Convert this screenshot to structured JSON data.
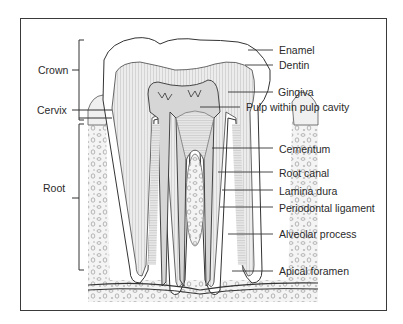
{
  "diagram": {
    "type": "anatomical cross-section",
    "left_labels": [
      {
        "id": "crown",
        "text": "Crown"
      },
      {
        "id": "cervix",
        "text": "Cervix"
      },
      {
        "id": "root",
        "text": "Root"
      }
    ],
    "right_labels": [
      {
        "id": "enamel",
        "text": "Enamel"
      },
      {
        "id": "dentin",
        "text": "Dentin"
      },
      {
        "id": "gingiva",
        "text": "Gingiva"
      },
      {
        "id": "pulp",
        "text": "Pulp within pulp cavity"
      },
      {
        "id": "cementum",
        "text": "Cementum"
      },
      {
        "id": "root_canal",
        "text": "Root canal"
      },
      {
        "id": "lamina_dura",
        "text": "Lamina dura"
      },
      {
        "id": "periodontal_ligament",
        "text": "Periodontal ligament"
      },
      {
        "id": "alveolar_process",
        "text": "Alveolar process"
      },
      {
        "id": "apical_foramen",
        "text": "Apical foramen"
      }
    ]
  },
  "colors": {
    "line": "#3a3a3a",
    "enamel": "#ffffff",
    "dentin": "#e4e4e4",
    "pulp": "#d2d2d2",
    "bone": "#f2f2f2"
  }
}
